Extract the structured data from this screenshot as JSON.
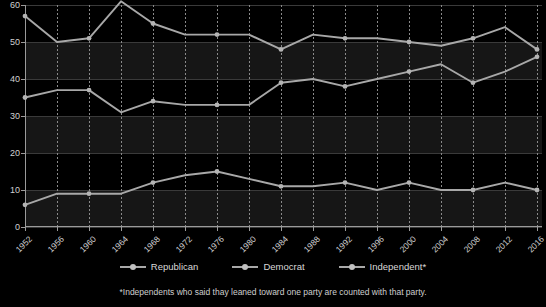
{
  "chart_data": {
    "type": "line",
    "title": "",
    "xlabel": "",
    "ylabel": "",
    "ylim": [
      0,
      60
    ],
    "ytick_values": [
      0,
      10,
      20,
      30,
      40,
      50,
      60
    ],
    "grid": "horizontal gridlines with alternating shaded bands; dotted vertical gridlines at each election year",
    "legend_position": "bottom-center",
    "categories": [
      1952,
      1956,
      1960,
      1964,
      1968,
      1972,
      1976,
      1980,
      1984,
      1988,
      1992,
      1996,
      2000,
      2004,
      2008,
      2012,
      2016
    ],
    "series": [
      {
        "name": "Democrat",
        "values": [
          57,
          50,
          51,
          61,
          55,
          52,
          52,
          52,
          48,
          52,
          51,
          51,
          50,
          49,
          51,
          54,
          48
        ]
      },
      {
        "name": "Republican",
        "values": [
          35,
          37,
          37,
          31,
          34,
          33,
          33,
          33,
          39,
          40,
          38,
          40,
          42,
          44,
          39,
          42,
          46
        ]
      },
      {
        "name": "Independent*",
        "values": [
          6,
          9,
          9,
          9,
          12,
          14,
          15,
          13,
          11,
          11,
          12,
          10,
          12,
          10,
          10,
          12,
          10
        ]
      }
    ],
    "footnote": "*Independents who said thay leaned toward one party are counted with that party.",
    "colors": {
      "background": "#000000",
      "line": "#a8a8a8",
      "marker": "#b4b4b4",
      "text": "#d0d0d0",
      "gridline": "#3a3a3a",
      "band": "#161616"
    }
  },
  "legend": {
    "items": [
      {
        "label": "Republican",
        "icon": "line-marker-icon"
      },
      {
        "label": "Democrat",
        "icon": "line-marker-icon"
      },
      {
        "label": "Independent*",
        "icon": "line-marker-icon"
      }
    ]
  }
}
